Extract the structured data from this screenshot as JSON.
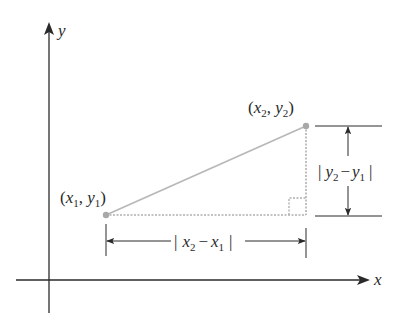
{
  "diagram": {
    "colors": {
      "axis": "#2a2a2a",
      "segment": "#b8b8b8",
      "dashed": "#b0b0b0",
      "point": "#a8a8a8",
      "dimension": "#2a2a2a",
      "background": "#ffffff"
    },
    "axes": {
      "x_label": "x",
      "y_label": "y"
    },
    "points": [
      {
        "name": "P1",
        "label_open": "(",
        "x_var": "x",
        "x_sub": "1",
        "sep": ", ",
        "y_var": "y",
        "y_sub": "1",
        "label_close": ")"
      },
      {
        "name": "P2",
        "label_open": "(",
        "x_var": "x",
        "x_sub": "2",
        "sep": ", ",
        "y_var": "y",
        "y_sub": "2",
        "label_close": ")"
      }
    ],
    "horizontal_distance": {
      "bar_left": "|",
      "a_var": "x",
      "a_sub": "2",
      "minus": "−",
      "b_var": "x",
      "b_sub": "1",
      "bar_right": "|"
    },
    "vertical_distance": {
      "bar_left": "|",
      "a_var": "y",
      "a_sub": "2",
      "minus": "−",
      "b_var": "y",
      "b_sub": "1",
      "bar_right": "|"
    },
    "right_angle_marker": "right-angle"
  }
}
